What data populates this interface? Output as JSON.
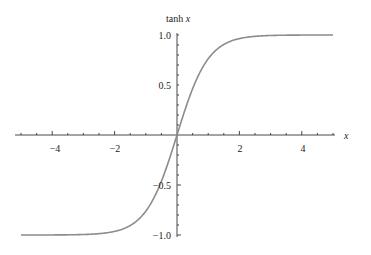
{
  "chart_data": {
    "type": "line",
    "title": "",
    "xlabel": "x",
    "ylabel": "tanh x",
    "xlim": [
      -5,
      5
    ],
    "ylim": [
      -1.0,
      1.0
    ],
    "grid": false,
    "legend": null,
    "x_ticks": [
      -4,
      -2,
      2,
      4
    ],
    "x_tick_labels": [
      "−4",
      "−2",
      "2",
      "4"
    ],
    "y_ticks": [
      1.0,
      0.5,
      -0.5,
      -1.0
    ],
    "y_tick_labels": [
      "1.0",
      "0.5",
      "−0.5",
      "−1.0"
    ],
    "series": [
      {
        "name": "tanh x",
        "color": "#8c8c8c",
        "x": [
          -5,
          -4,
          -3,
          -2.5,
          -2,
          -1.5,
          -1,
          -0.5,
          0,
          0.5,
          1,
          1.5,
          2,
          2.5,
          3,
          4,
          5
        ],
        "y": [
          -0.9999,
          -0.9993,
          -0.9951,
          -0.9866,
          -0.964,
          -0.9051,
          -0.7616,
          -0.4621,
          0,
          0.4621,
          0.7616,
          0.9051,
          0.964,
          0.9866,
          0.9951,
          0.9993,
          0.9999
        ]
      }
    ]
  },
  "labels": {
    "x_axis": "x",
    "y_axis": "tanh x",
    "xt0": "−4",
    "xt1": "−2",
    "xt2": "2",
    "xt3": "4",
    "yt0": "1.0",
    "yt1": "0.5",
    "yt2": "−0.5",
    "yt3": "−1.0"
  }
}
